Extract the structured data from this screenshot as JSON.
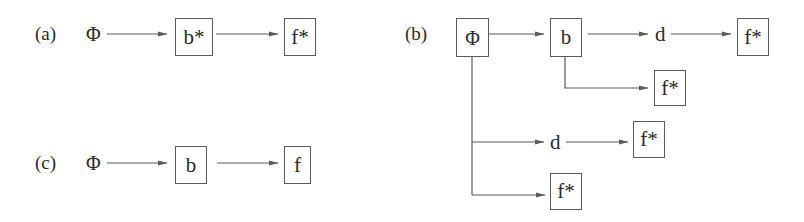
{
  "diagram": {
    "panels": [
      {
        "id": "a",
        "label": "(a)",
        "nodes": [
          {
            "id": "a-phi",
            "text": "Φ",
            "boxed": false
          },
          {
            "id": "a-b",
            "text": "b*",
            "boxed": true
          },
          {
            "id": "a-f",
            "text": "f*",
            "boxed": true
          }
        ],
        "edges": [
          {
            "from": "a-phi",
            "to": "a-b"
          },
          {
            "from": "a-b",
            "to": "a-f"
          }
        ]
      },
      {
        "id": "b",
        "label": "(b)",
        "nodes": [
          {
            "id": "b-phi",
            "text": "Φ",
            "boxed": true
          },
          {
            "id": "b-b",
            "text": "b",
            "boxed": true
          },
          {
            "id": "b-d1",
            "text": "d",
            "boxed": false
          },
          {
            "id": "b-f1",
            "text": "f*",
            "boxed": true
          },
          {
            "id": "b-f2",
            "text": "f*",
            "boxed": true
          },
          {
            "id": "b-d2",
            "text": "d",
            "boxed": false
          },
          {
            "id": "b-f3",
            "text": "f*",
            "boxed": true
          },
          {
            "id": "b-f4",
            "text": "f*",
            "boxed": true
          }
        ],
        "edges": [
          {
            "from": "b-phi",
            "to": "b-b"
          },
          {
            "from": "b-b",
            "to": "b-d1"
          },
          {
            "from": "b-d1",
            "to": "b-f1"
          },
          {
            "from": "b-b",
            "to": "b-f2"
          },
          {
            "from": "b-phi",
            "to": "b-d2"
          },
          {
            "from": "b-d2",
            "to": "b-f3"
          },
          {
            "from": "b-phi",
            "to": "b-f4"
          }
        ]
      },
      {
        "id": "c",
        "label": "(c)",
        "nodes": [
          {
            "id": "c-phi",
            "text": "Φ",
            "boxed": false
          },
          {
            "id": "c-b",
            "text": "b",
            "boxed": true
          },
          {
            "id": "c-f",
            "text": "f",
            "boxed": true
          }
        ],
        "edges": [
          {
            "from": "c-phi",
            "to": "c-b"
          },
          {
            "from": "c-b",
            "to": "c-f"
          }
        ]
      }
    ],
    "colors": {
      "line": "#5a5a5a",
      "text": "#2a2a2a",
      "background": "#ffffff"
    }
  }
}
